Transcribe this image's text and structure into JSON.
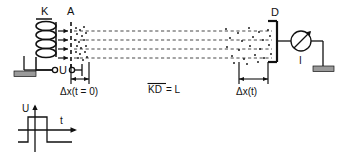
{
  "figure": {
    "title_visible": false,
    "background": "#ffffff",
    "stroke": "#111111",
    "ground_fill": "#9a9a9a",
    "dash_color": "#333333"
  },
  "labels": {
    "cathode": "K",
    "anode": "A",
    "detector": "D",
    "voltage_source": "U",
    "current": "I",
    "delta_x_initial": "Δx(t = 0)",
    "delta_x_time": "Δx(t)",
    "distance_kd_overline": "KD",
    "distance_equals": " = L"
  },
  "graph": {
    "y_axis_label": "U",
    "x_axis_label": "t",
    "type": "step-pulse",
    "description": "voltage pulse: low level, step up, step back down"
  },
  "components": {
    "coil_turns": 4,
    "emission_arrows": 4,
    "trajectory_lines": 4,
    "grounds": 2,
    "meter": "galvanometer-circle-with-arrow"
  }
}
